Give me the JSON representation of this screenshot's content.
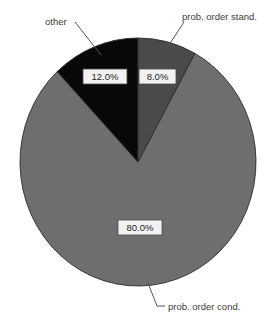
{
  "chart_data": {
    "type": "pie",
    "title": "",
    "subtitle": "",
    "xlabel": "",
    "ylabel": "",
    "legend_position": "none",
    "grid": false,
    "categories": [
      "prob. order cond.",
      "other",
      "prob. order stand."
    ],
    "values": [
      80.0,
      12.0,
      8.0
    ],
    "value_labels": [
      "80.0%",
      "8.0%",
      "12.0%"
    ],
    "slices": [
      {
        "label": "prob. order cond.",
        "value": 80.0,
        "value_label": "80.0%",
        "color": "#6e6e6e",
        "callout_position": "bottom-right"
      },
      {
        "label": "other",
        "value": 12.0,
        "value_label": "12.0%",
        "color": "#080808",
        "callout_position": "top-left"
      },
      {
        "label": "prob. order stand.",
        "value": 8.0,
        "value_label": "8.0%",
        "color": "#4a4a4a",
        "callout_position": "top-right"
      }
    ]
  },
  "labels": {
    "other": "other",
    "prob_order_stand": "prob. order stand.",
    "prob_order_cond": "prob. order cond.",
    "pct_other": "12.0%",
    "pct_stand": "8.0%",
    "pct_cond": "80.0%"
  },
  "colors": {
    "background": "#ffffff",
    "slice_cond": "#6e6e6e",
    "slice_other": "#080808",
    "slice_stand": "#4a4a4a",
    "outline": "#2b2b2b",
    "leader_line": "#555555",
    "label_text": "#3a3a3a",
    "pct_box_fill": "#f2f2f2",
    "pct_box_border": "#4a4a4a"
  }
}
